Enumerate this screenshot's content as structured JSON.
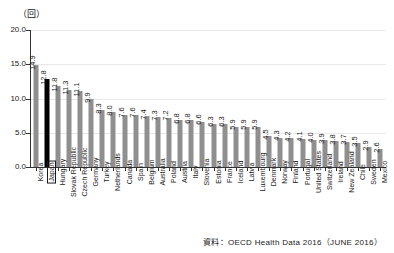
{
  "unit_label": "（回）",
  "source_note": "資料：OECD Health Data 2016（JUNE 2016）",
  "colors": {
    "bar": "#8f8f8f",
    "highlight_bar": "#000000",
    "axis": "#333333",
    "grid": "#e9e9e9",
    "background": "#ffffff",
    "text": "#1a1a1a"
  },
  "highlight_country": "Japan",
  "chart_data": {
    "type": "bar",
    "title": "",
    "subtitle": "",
    "xlabel": "",
    "ylabel": "（回）",
    "ylim": [
      0.0,
      20.0
    ],
    "ytick_labels": [
      "0.0",
      "5.0",
      "10.0",
      "15.0",
      "20.0"
    ],
    "ytick_values": [
      0.0,
      5.0,
      10.0,
      15.0,
      20.0
    ],
    "grid": true,
    "legend": "none",
    "categories": [
      "Korea",
      "Japan",
      "Hungary",
      "Slovak Republic",
      "Czech Republic",
      "Germany",
      "Turkey",
      "Netherlands",
      "Canada",
      "Spain",
      "Belgium",
      "Australia",
      "Poland",
      "Austria",
      "Italy",
      "Slovenia",
      "Estonia",
      "France",
      "Iceland",
      "Latvia",
      "Luxembourg",
      "Denmark",
      "Norway",
      "Finland",
      "Portugal",
      "United States",
      "Switzerland",
      "Ireland",
      "New Zealand",
      "Chile",
      "Sweden",
      "Mexico"
    ],
    "values": [
      14.9,
      12.8,
      11.8,
      11.3,
      11.1,
      9.9,
      8.3,
      8.0,
      7.6,
      7.6,
      7.4,
      7.3,
      7.2,
      6.8,
      6.8,
      6.6,
      6.3,
      6.3,
      5.9,
      5.9,
      5.9,
      4.5,
      4.3,
      4.2,
      4.1,
      4.0,
      3.9,
      3.8,
      3.7,
      3.5,
      2.9,
      2.6
    ],
    "value_labels": [
      "14.9",
      "12.8",
      "11.8",
      "11.3",
      "11.1",
      "9.9",
      "8.3",
      "8.0",
      "7.6",
      "7.6",
      "7.4",
      "7.3",
      "7.2",
      "6.8",
      "6.8",
      "6.6",
      "6.3",
      "6.3",
      "5.9",
      "5.9",
      "5.9",
      "4.5",
      "4.3",
      "4.2",
      "4.1",
      "4.0",
      "3.9",
      "3.8",
      "3.7",
      "3.5",
      "2.9",
      "2.6"
    ]
  }
}
